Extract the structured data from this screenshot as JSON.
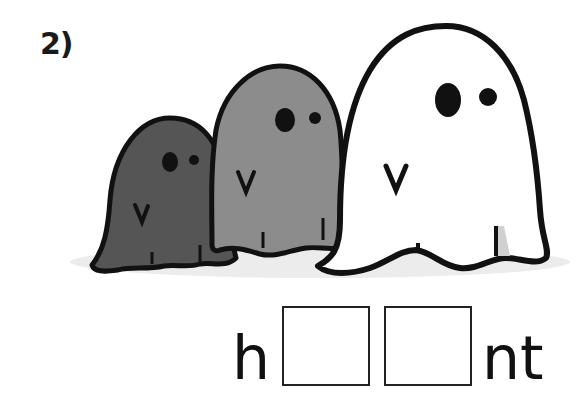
{
  "exercise": {
    "number_label": "2)",
    "illustration": {
      "subject": "three ghosts",
      "ghosts": [
        {
          "size": "small",
          "fill": "#555555"
        },
        {
          "size": "medium",
          "fill": "#8c8c8c"
        },
        {
          "size": "large",
          "fill": "#ffffff"
        }
      ],
      "outline_color": "#111111",
      "shadow_color": "#e6e6e6"
    },
    "word_puzzle": {
      "prefix": "h",
      "blank_count": 2,
      "suffix": "nt"
    }
  }
}
